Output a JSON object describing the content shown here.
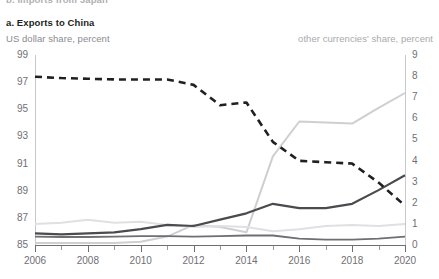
{
  "header": {
    "clipped_above": "b. Imports from Japan",
    "panel_label": "a. Exports to China",
    "left_axis_title": "US dollar share, percent",
    "right_axis_title": "other currencies' share, percent"
  },
  "colors": {
    "dashed_usd": "#231f20",
    "solid_dark": "#4a4a4f",
    "light_gray": "#cfcfd2",
    "very_light": "#e4e4e6",
    "axis": "#c9c9cd",
    "axis_bottom": "#6e6e73",
    "tick_text": "#6f6f74",
    "title_text": "#231f20",
    "subtitle_text": "#8a8a90",
    "subtitle_right_text": "#a9a9ad",
    "background": "#ffffff"
  },
  "chart_data": {
    "type": "line",
    "title": "a. Exports to China",
    "xlabel": "",
    "ylabel": "US dollar share, percent",
    "ylabel_right": "other currencies' share, percent",
    "grid": false,
    "legend": "none",
    "x": [
      2006,
      2007,
      2008,
      2009,
      2010,
      2011,
      2012,
      2013,
      2014,
      2015,
      2016,
      2017,
      2018,
      2019,
      2020
    ],
    "xlim": [
      2006,
      2020
    ],
    "xticks": [
      2006,
      2008,
      2010,
      2012,
      2014,
      2016,
      2018,
      2020
    ],
    "xticklabels": [
      "2006",
      "2008",
      "2010",
      "2012",
      "2014",
      "2016",
      "2018",
      "2020"
    ],
    "ylim_left": [
      85,
      99
    ],
    "yticks_left": [
      85,
      87,
      89,
      91,
      93,
      95,
      97,
      99
    ],
    "yticklabels_left": [
      "85",
      "87",
      "89",
      "91",
      "93",
      "95",
      "97",
      "99"
    ],
    "ylim_right": [
      0,
      9
    ],
    "yticks_right": [
      0,
      1,
      2,
      3,
      4,
      5,
      6,
      7,
      8,
      9
    ],
    "yticklabels_right": [
      "0",
      "1",
      "2",
      "3",
      "4",
      "5",
      "6",
      "7",
      "8",
      "9"
    ],
    "series": [
      {
        "name": "US dollar share",
        "axis": "left",
        "style": "dashed",
        "color": "#231f20",
        "width": 2.6,
        "values": [
          97.4,
          97.3,
          97.25,
          97.2,
          97.2,
          97.2,
          96.8,
          95.3,
          95.5,
          92.6,
          91.2,
          91.1,
          91.0,
          89.6,
          87.9
        ]
      },
      {
        "name": "other currencies A",
        "axis": "right",
        "style": "solid",
        "color": "#cfcfd2",
        "width": 2.0,
        "values": [
          0.1,
          0.1,
          0.1,
          0.1,
          0.15,
          0.4,
          0.95,
          0.85,
          0.6,
          4.2,
          5.85,
          5.8,
          5.75,
          6.5,
          7.2
        ]
      },
      {
        "name": "other currencies B",
        "axis": "right",
        "style": "solid",
        "color": "#4a4a4f",
        "width": 2.2,
        "values": [
          0.55,
          0.5,
          0.55,
          0.6,
          0.75,
          0.95,
          0.9,
          1.2,
          1.5,
          1.95,
          1.75,
          1.75,
          1.95,
          2.6,
          3.3
        ]
      },
      {
        "name": "other currencies C",
        "axis": "right",
        "style": "solid",
        "color": "#e0e0e3",
        "width": 2.0,
        "values": [
          1.0,
          1.05,
          1.2,
          1.05,
          1.1,
          0.95,
          0.85,
          0.9,
          0.85,
          0.65,
          0.75,
          0.9,
          0.95,
          0.9,
          1.0
        ]
      },
      {
        "name": "other currencies D",
        "axis": "right",
        "style": "solid",
        "color": "#6e6e73",
        "width": 1.8,
        "values": [
          0.4,
          0.38,
          0.38,
          0.4,
          0.42,
          0.42,
          0.4,
          0.42,
          0.45,
          0.45,
          0.3,
          0.25,
          0.25,
          0.3,
          0.4
        ]
      }
    ]
  }
}
